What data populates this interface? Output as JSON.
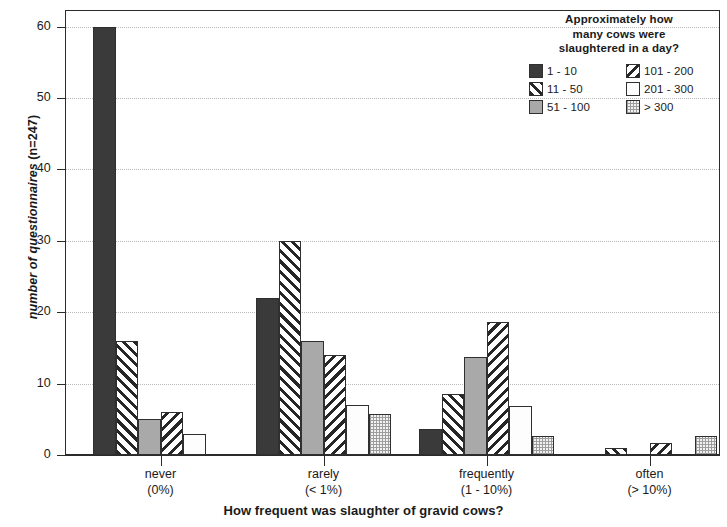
{
  "chart_data": {
    "type": "bar",
    "title": "",
    "xlabel": "How frequent was slaughter of gravid cows?",
    "ylabel": "number of questionnaires (n=247)",
    "ylim": [
      0,
      62.2
    ],
    "yticks": [
      0,
      10,
      20,
      30,
      40,
      50,
      60
    ],
    "ytick_labels": [
      "0",
      "10",
      "20",
      "30",
      "40",
      "50",
      "60"
    ],
    "grid": "horizontal-dotted",
    "legend_position": "top-right-inside",
    "legend_title": "Approximately how many cows were slaughtered in a day?",
    "categories": [
      "never",
      "rarely",
      "frequently",
      "often"
    ],
    "category_sublabels": [
      "(0%)",
      "(< 1%)",
      "(1 - 10%)",
      "(> 10%)"
    ],
    "series": [
      {
        "name": "1 - 10",
        "pattern": "solid-dark",
        "values": [
          60,
          22,
          3.7,
          0
        ]
      },
      {
        "name": "11 - 50",
        "pattern": "diagonal-backward",
        "values": [
          16,
          30,
          8.6,
          1
        ]
      },
      {
        "name": "51 - 100",
        "pattern": "solid-gray",
        "values": [
          5,
          16,
          13.8,
          0
        ]
      },
      {
        "name": "101 - 200",
        "pattern": "diagonal-forward",
        "values": [
          6,
          14,
          18.7,
          1.7
        ]
      },
      {
        "name": "201 - 300",
        "pattern": "white",
        "values": [
          3,
          7,
          6.8,
          0
        ]
      },
      {
        "name": "> 300",
        "pattern": "dotted",
        "values": [
          0,
          5.7,
          2.7,
          2.6
        ]
      }
    ]
  },
  "legend": {
    "title_lines": [
      "Approximately how",
      "many cows were",
      "slaughtered in a day?"
    ],
    "items": [
      {
        "label": "1 - 10",
        "pattern": "solid-dark"
      },
      {
        "label": "101 - 200",
        "pattern": "diagonal-forward"
      },
      {
        "label": "11 - 50",
        "pattern": "diagonal-backward"
      },
      {
        "label": "201 - 300",
        "pattern": "white"
      },
      {
        "label": "51 - 100",
        "pattern": "solid-gray"
      },
      {
        "label": "> 300",
        "pattern": "dotted"
      }
    ]
  },
  "axes": {
    "y_title_main": "number of questionnaires",
    "y_title_note": "(n=247)",
    "x_title": "How frequent was slaughter of gravid cows?"
  }
}
